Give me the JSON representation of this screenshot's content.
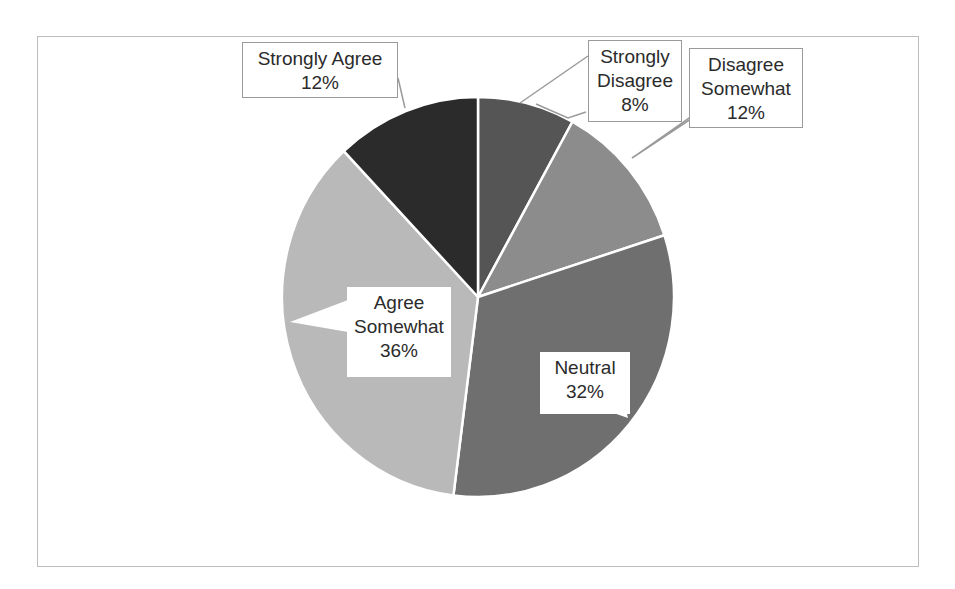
{
  "chart_data": {
    "type": "pie",
    "title": "",
    "categories": [
      "Strongly Disagree",
      "Disagree Somewhat",
      "Neutral",
      "Agree Somewhat",
      "Strongly Agree"
    ],
    "values": [
      8,
      12,
      32,
      36,
      12
    ],
    "value_labels": [
      "8%",
      "12%",
      "32%",
      "36%",
      "12%"
    ],
    "colors": [
      "#555555",
      "#8c8c8c",
      "#6f6f6f",
      "#b9b9b9",
      "#2b2b2b"
    ],
    "start_angle_deg": 0,
    "direction": "clockwise",
    "legend": "none",
    "data_labels": "callouts"
  },
  "labels": {
    "strongly_agree": {
      "line1": "Strongly Agree",
      "pct": "12%"
    },
    "strongly_disagree": {
      "line1": "Strongly",
      "line2": "Disagree",
      "pct": "8%"
    },
    "disagree_somewhat": {
      "line1": "Disagree",
      "line2": "Somewhat",
      "pct": "12%"
    },
    "agree_somewhat": {
      "line1": "Agree",
      "line2": "Somewhat",
      "pct": "36%"
    },
    "neutral": {
      "line1": "Neutral",
      "pct": "32%"
    }
  }
}
